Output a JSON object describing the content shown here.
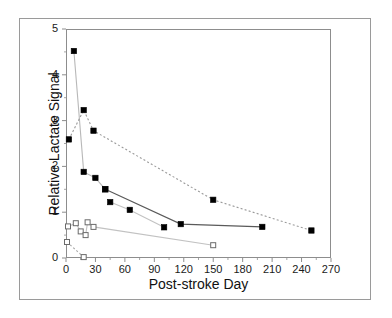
{
  "chart_data": {
    "type": "line",
    "title": "",
    "xlabel": "Post-stroke Day",
    "ylabel": "Relative Lactate Signal",
    "xlim": [
      0,
      270
    ],
    "ylim": [
      0,
      5
    ],
    "xticks": [
      0,
      30,
      60,
      90,
      120,
      150,
      180,
      210,
      240,
      270
    ],
    "yticks": [
      0,
      1,
      2,
      3,
      4,
      5
    ],
    "xtick_labels": [
      "0",
      "30",
      "60",
      "90",
      "120",
      "150",
      "180",
      "210",
      "240",
      "270"
    ],
    "ytick_labels": [
      "0",
      "1",
      "2",
      "3",
      "4",
      "5"
    ],
    "grid": false,
    "legend": "none",
    "series": [
      {
        "name": "subject-1-steep-decline",
        "marker": "filled-square",
        "linestyle": "solid",
        "color": "#000000",
        "linecolor": "#b8b8b8",
        "points": [
          [
            8,
            4.52
          ],
          [
            18,
            1.88
          ],
          [
            30,
            1.75
          ],
          [
            40,
            1.5
          ]
        ]
      },
      {
        "name": "subject-2-upper-dashed",
        "marker": "filled-square",
        "linestyle": "dashed",
        "color": "#000000",
        "linecolor": "#9a9a9a",
        "points": [
          [
            3,
            2.59
          ],
          [
            18,
            3.23
          ],
          [
            28,
            2.78
          ],
          [
            150,
            1.27
          ],
          [
            250,
            0.6
          ]
        ]
      },
      {
        "name": "subject-3-middle-solid",
        "marker": "filled-square",
        "linestyle": "solid",
        "color": "#000000",
        "linecolor": "#5a5a5a",
        "points": [
          [
            40,
            1.5
          ],
          [
            117,
            0.74
          ],
          [
            200,
            0.68
          ]
        ]
      },
      {
        "name": "subject-4-lower-solid",
        "marker": "filled-square",
        "linestyle": "solid",
        "color": "#000000",
        "linecolor": "#c2c2c2",
        "points": [
          [
            45,
            1.22
          ],
          [
            65,
            1.05
          ],
          [
            100,
            0.67
          ]
        ]
      },
      {
        "name": "subject-5-open-square-cluster",
        "marker": "open-square",
        "linestyle": "solid",
        "color": "#6b6b6b",
        "linecolor": "#c2c2c2",
        "points": [
          [
            2,
            0.69
          ],
          [
            10,
            0.76
          ],
          [
            15,
            0.58
          ],
          [
            20,
            0.5
          ],
          [
            22,
            0.78
          ],
          [
            28,
            0.68
          ],
          [
            150,
            0.28
          ]
        ]
      },
      {
        "name": "subject-6-open-square-dashed",
        "marker": "open-square",
        "linestyle": "dashed",
        "color": "#6b6b6b",
        "linecolor": "#a8a8a8",
        "points": [
          [
            1,
            0.35
          ],
          [
            18,
            0.02
          ]
        ]
      }
    ]
  },
  "axes": {
    "x_title": "Post-stroke Day",
    "y_title": "Relative Lactate Signal"
  }
}
